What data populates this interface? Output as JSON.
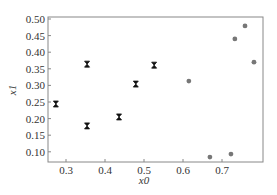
{
  "chart_data": {
    "type": "scatter",
    "title": "",
    "xlabel": "x0",
    "ylabel": "x1",
    "xlim": [
      0.255,
      0.79
    ],
    "ylim": [
      0.06,
      0.505
    ],
    "grid": false,
    "legend": null,
    "x_ticks": [
      "0.3",
      "0.4",
      "0.5",
      "0.6",
      "0.7"
    ],
    "y_ticks": [
      "0.10",
      "0.15",
      "0.20",
      "0.25",
      "0.30",
      "0.35",
      "0.40",
      "0.45",
      "0.50"
    ],
    "series": [
      {
        "name": "hourglass markers",
        "marker": "hourglass",
        "color": "#111111",
        "points": [
          {
            "x": 0.274,
            "y": 0.244
          },
          {
            "x": 0.354,
            "y": 0.364
          },
          {
            "x": 0.354,
            "y": 0.178
          },
          {
            "x": 0.436,
            "y": 0.205
          },
          {
            "x": 0.479,
            "y": 0.304
          },
          {
            "x": 0.526,
            "y": 0.361
          }
        ]
      },
      {
        "name": "circle markers",
        "marker": "circle",
        "color": "#777777",
        "points": [
          {
            "x": 0.615,
            "y": 0.313
          },
          {
            "x": 0.669,
            "y": 0.084
          },
          {
            "x": 0.723,
            "y": 0.093
          },
          {
            "x": 0.733,
            "y": 0.44
          },
          {
            "x": 0.759,
            "y": 0.479
          },
          {
            "x": 0.782,
            "y": 0.37
          }
        ]
      }
    ]
  }
}
